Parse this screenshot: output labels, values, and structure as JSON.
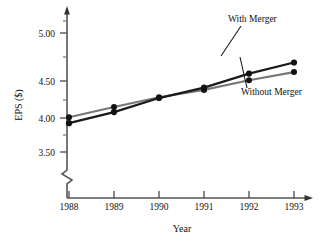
{
  "chart_data": {
    "type": "line",
    "title": "",
    "xlabel": "Year",
    "ylabel": "EPS ($)",
    "x": [
      1988,
      1989,
      1990,
      1991,
      1992,
      1993
    ],
    "xticklabels": [
      "1988",
      "1989",
      "1990",
      "1991",
      "1992",
      "1993"
    ],
    "yticklabels": [
      "3.50",
      "4.00",
      "4.50",
      "5.00"
    ],
    "yticks": [
      3.5,
      4.0,
      4.5,
      5.0
    ],
    "yminorticks": [
      3.75,
      4.25,
      4.75,
      5.25
    ],
    "ylim": [
      3.3,
      5.25
    ],
    "xlim": [
      1987.6,
      1993.6
    ],
    "grid": false,
    "axis_break": true,
    "legend_position": "inline-annotations",
    "series": [
      {
        "name": "With Merger",
        "color": "#1a1a1a",
        "values": [
          3.93,
          4.08,
          4.27,
          4.41,
          4.6,
          4.75
        ]
      },
      {
        "name": "Without Merger",
        "color": "#777777",
        "values": [
          4.01,
          4.15,
          4.28,
          4.38,
          4.51,
          4.62
        ]
      }
    ],
    "annotations": [
      {
        "text": "With Merger",
        "target_series": "With Merger"
      },
      {
        "text": "Without Merger",
        "target_series": "Without Merger"
      }
    ]
  },
  "labels": {
    "y_axis_title": "EPS ($)",
    "x_axis_title": "Year",
    "ytick_0": "3.50",
    "ytick_1": "4.00",
    "ytick_2": "4.50",
    "ytick_3": "5.00",
    "xtick_0": "1988",
    "xtick_1": "1989",
    "xtick_2": "1990",
    "xtick_3": "1991",
    "xtick_4": "1992",
    "xtick_5": "1993",
    "series_with": "With Merger",
    "series_without": "Without Merger"
  },
  "colors": {
    "with_merger": "#1a1a1a",
    "without_merger": "#777777",
    "axis": "#555555",
    "text": "#111111",
    "background": "#ffffff"
  }
}
